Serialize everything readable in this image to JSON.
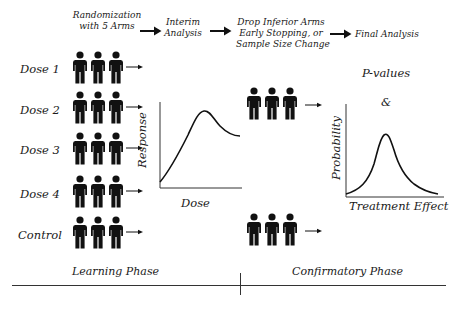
{
  "header": {
    "steps": [
      {
        "label_line1": "Randomization",
        "label_line2": "with 5 Arms"
      },
      {
        "label_line1": "Interim",
        "label_line2": "Analysis"
      },
      {
        "label_line1": "Drop Inferior Arms",
        "label_line2": "Early Stopping, or",
        "label_line3": "Sample Size Change"
      },
      {
        "label_line1": "Final Analysis"
      }
    ]
  },
  "arms": [
    {
      "label": "Dose 1"
    },
    {
      "label": "Dose 2"
    },
    {
      "label": "Dose 3"
    },
    {
      "label": "Dose 4"
    },
    {
      "label": "Control"
    }
  ],
  "dose_response_chart": {
    "xlabel": "Dose",
    "ylabel": "Response"
  },
  "probability_chart": {
    "xlabel": "Treatment Effect",
    "ylabel": "Probability"
  },
  "final": {
    "pvalues": "P-values",
    "ampersand": "&"
  },
  "phases": {
    "learning": "Learning Phase",
    "confirmatory": "Confirmatory Phase"
  },
  "icons": {
    "person": "person-icon",
    "arrow": "arrow-right-icon"
  }
}
